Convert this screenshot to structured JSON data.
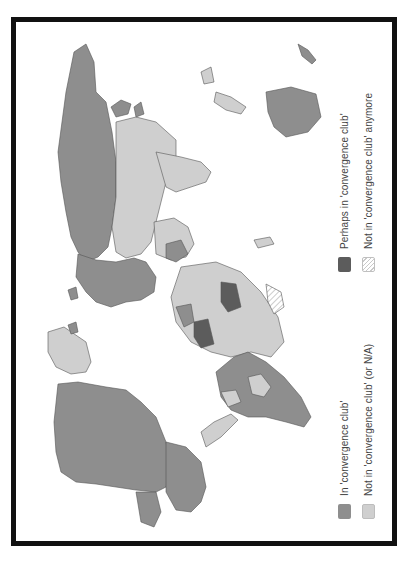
{
  "map": {
    "type": "choropleth world map (rotated 90° counter-clockwise)",
    "colors": {
      "in_club": "#8e8e8e",
      "not_in_club": "#cfcfcf",
      "perhaps": "#5c5c5c",
      "not_anymore": "hatched",
      "border": "#555555",
      "frame": "#111111"
    }
  },
  "legend": {
    "items": [
      {
        "id": "in",
        "label": "In 'convergence club'"
      },
      {
        "id": "notin",
        "label": "Not in 'convergence club' (or N/A)"
      },
      {
        "id": "perhaps",
        "label": "Perhaps in 'convergence club'"
      },
      {
        "id": "anymore",
        "label": "Not in 'convergence club' anymore"
      }
    ]
  }
}
